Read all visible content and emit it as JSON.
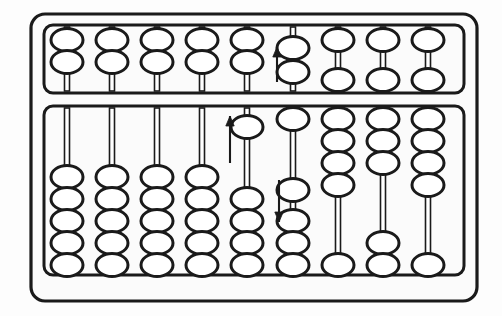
{
  "device": {
    "name": "abacus",
    "type": "suanpan",
    "rod_count": 9,
    "upper_deck_beads_per_rod": 2,
    "lower_deck_beads_per_rod": 5,
    "title": "Abacus"
  },
  "colors": {
    "ink": "#1a1a1a",
    "frame_fill": "#fbfbfb",
    "background": "#fdfdfd",
    "bead_fill": "#ffffff",
    "rod_fill": "#ffffff"
  },
  "geometry": {
    "outer_frame": {
      "x": 31,
      "y": 14,
      "width": 446,
      "height": 287,
      "radius": 14,
      "stroke": 3.2
    },
    "upper_deck": {
      "x": 44,
      "y": 25,
      "width": 420,
      "height": 68,
      "radius": 9,
      "stroke": 3.0
    },
    "lower_deck": {
      "x": 44,
      "y": 106,
      "width": 420,
      "height": 169,
      "radius": 9,
      "stroke": 3.0
    },
    "rod_x": [
      67,
      112,
      157,
      202,
      247,
      293,
      338,
      383,
      428
    ],
    "rod_width": 5,
    "bead_rx": 16,
    "bead_ry": 11.5,
    "bead_stroke": 3.0,
    "upper_top_slot_y": [
      40,
      62
    ],
    "upper_bottom_slot_y": [
      40,
      80
    ],
    "lower_top_start_y": 119,
    "lower_bottom_end_y": 265,
    "lower_step_y": 22
  },
  "rods": [
    {
      "index": 1,
      "name": "rod-1",
      "upper": {
        "layout": "both-up",
        "bead_y": [
          40,
          62
        ],
        "value": 0
      },
      "lower": {
        "layout": "all-down",
        "bead_y": [
          177,
          199,
          221,
          243,
          265
        ],
        "value": 0
      }
    },
    {
      "index": 2,
      "name": "rod-2",
      "upper": {
        "layout": "both-up",
        "bead_y": [
          40,
          62
        ],
        "value": 0
      },
      "lower": {
        "layout": "all-down",
        "bead_y": [
          177,
          199,
          221,
          243,
          265
        ],
        "value": 0
      }
    },
    {
      "index": 3,
      "name": "rod-3",
      "upper": {
        "layout": "both-up",
        "bead_y": [
          40,
          62
        ],
        "value": 0
      },
      "lower": {
        "layout": "all-down",
        "bead_y": [
          177,
          199,
          221,
          243,
          265
        ],
        "value": 0
      }
    },
    {
      "index": 4,
      "name": "rod-4",
      "upper": {
        "layout": "both-up",
        "bead_y": [
          40,
          62
        ],
        "value": 0
      },
      "lower": {
        "layout": "all-down",
        "bead_y": [
          177,
          199,
          221,
          243,
          265
        ],
        "value": 0
      }
    },
    {
      "index": 5,
      "name": "rod-5",
      "upper": {
        "layout": "both-up",
        "bead_y": [
          40,
          62
        ],
        "value": 0
      },
      "lower": {
        "layout": "one-up-four-down",
        "bead_y": [
          127,
          199,
          221,
          243,
          265
        ],
        "value": 1
      }
    },
    {
      "index": 6,
      "name": "rod-6",
      "upper": {
        "layout": "both-lowered",
        "bead_y": [
          48,
          72
        ],
        "value": 0
      },
      "lower": {
        "layout": "one-up-one-mid-three-down",
        "bead_y": [
          119,
          190,
          221,
          243,
          265
        ],
        "value": 2
      }
    },
    {
      "index": 7,
      "name": "rod-7",
      "upper": {
        "layout": "split",
        "bead_y": [
          40,
          80
        ],
        "value": 5
      },
      "lower": {
        "layout": "four-up-one-down",
        "bead_y": [
          119,
          141,
          163,
          185,
          265
        ],
        "value": 4
      }
    },
    {
      "index": 8,
      "name": "rod-8",
      "upper": {
        "layout": "split",
        "bead_y": [
          40,
          80
        ],
        "value": 5
      },
      "lower": {
        "layout": "three-up-two-down",
        "bead_y": [
          119,
          141,
          163,
          243,
          265
        ],
        "value": 3
      }
    },
    {
      "index": 9,
      "name": "rod-9",
      "upper": {
        "layout": "split",
        "bead_y": [
          40,
          80
        ],
        "value": 5
      },
      "lower": {
        "layout": "four-up-one-down",
        "bead_y": [
          119,
          141,
          163,
          185,
          265
        ],
        "value": 4
      }
    }
  ],
  "arrows": [
    {
      "name": "arrow-up-upper-deck-rod6",
      "direction": "up",
      "x": 277,
      "y_tail": 82,
      "y_head": 47,
      "deck": "upper",
      "near_rod": 6
    },
    {
      "name": "arrow-up-lower-deck-rod5",
      "direction": "up",
      "x": 230,
      "y_tail": 163,
      "y_head": 116,
      "deck": "lower",
      "near_rod": 5
    },
    {
      "name": "arrow-down-lower-deck-rod6",
      "direction": "down",
      "x": 279,
      "y_tail": 180,
      "y_head": 222,
      "deck": "lower",
      "near_rod": 6
    }
  ]
}
